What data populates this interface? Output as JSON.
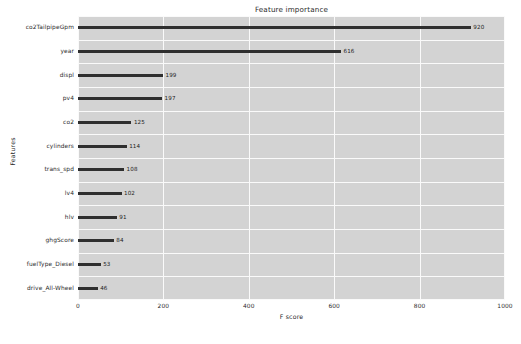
{
  "chart_data": {
    "type": "bar",
    "orientation": "horizontal",
    "title": "Feature importance",
    "xlabel": "F score",
    "ylabel": "Features",
    "categories": [
      "co2TailpipeGpm",
      "year",
      "displ",
      "pv4",
      "co2",
      "cylinders",
      "trans_spd",
      "lv4",
      "hlv",
      "ghgScore",
      "fuelType_Diesel",
      "drive_All-Wheel"
    ],
    "values": [
      920,
      616,
      199,
      197,
      125,
      114,
      108,
      102,
      91,
      84,
      53,
      46
    ],
    "value_labels": [
      "920",
      "616",
      "199",
      "197",
      "125",
      "114",
      "108",
      "102",
      "91",
      "84",
      "53",
      "46"
    ],
    "xlim": [
      0,
      1000
    ],
    "xticks": [
      0,
      200,
      400,
      600,
      800,
      1000
    ],
    "xtick_labels": [
      "0",
      "200",
      "400",
      "600",
      "800",
      "1000"
    ],
    "grid": true,
    "legend": null,
    "bar_color": "#2f2f2f",
    "plot_background": "#d3d3d3",
    "grid_color": "#fafafa",
    "figure_background": "#ffffff"
  }
}
